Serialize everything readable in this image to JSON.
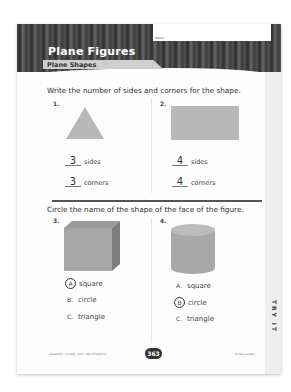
{
  "header": {
    "name_label": "Name:",
    "title": "Plane Figures",
    "subtitle": "Plane Shapes"
  },
  "section1": {
    "instruction": "Write the number of sides and corners for the shape.",
    "questions": [
      {
        "number": "1.",
        "shape": "triangle",
        "sides": "3",
        "corners": "3",
        "sides_label": "sides",
        "corners_label": "corners"
      },
      {
        "number": "2.",
        "shape": "rectangle",
        "sides": "4",
        "corners": "4",
        "sides_label": "sides",
        "corners_label": "corners"
      }
    ]
  },
  "section2": {
    "instruction": "Circle the name of the shape of the face of the figure.",
    "questions": [
      {
        "number": "3.",
        "figure": "cube",
        "options": [
          {
            "letter": "A",
            "text": "square",
            "circled": true
          },
          {
            "letter": "B.",
            "text": "circle",
            "circled": false
          },
          {
            "letter": "C.",
            "text": "triangle",
            "circled": false
          }
        ]
      },
      {
        "number": "4.",
        "figure": "cylinder",
        "options": [
          {
            "letter": "A.",
            "text": "square",
            "circled": false
          },
          {
            "letter": "B",
            "text": "circle",
            "circled": true
          },
          {
            "letter": "C.",
            "text": "triangle",
            "circled": false
          }
        ]
      }
    ]
  },
  "side_tab": "TRY IT",
  "footer": {
    "left": "GEOMETRIC FIGURES, DATA, AND ATTRIBUTES",
    "page_number": "363",
    "right": "PLANE FIGURES"
  },
  "colors": {
    "shape_fill": "#b8b8b8",
    "banner_dark": "#3a3a3a"
  }
}
